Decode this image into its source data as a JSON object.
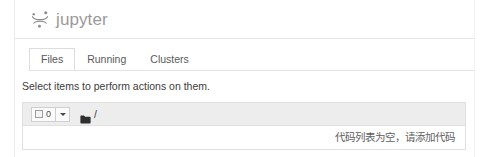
{
  "header": {
    "logo_icon": "jupyter-logo-icon",
    "wordmark": "jupyter"
  },
  "tabs": [
    {
      "label": "Files",
      "active": true
    },
    {
      "label": "Running",
      "active": false
    },
    {
      "label": "Clusters",
      "active": false
    }
  ],
  "instruction": "Select items to perform actions on them.",
  "toolbar": {
    "checkbox_icon": "checkbox-unchecked-icon",
    "selected_count": "0",
    "dropdown_icon": "caret-down-icon",
    "folder_icon": "folder-icon",
    "breadcrumb_path": "/"
  },
  "file_list": {
    "empty_message": "代码列表为空，请添加代码"
  },
  "colors": {
    "toolbar_background": "#ededed",
    "panel_border": "#e0e0e0",
    "wordmark": "#9a9a9a",
    "text": "#3c3c3c"
  }
}
